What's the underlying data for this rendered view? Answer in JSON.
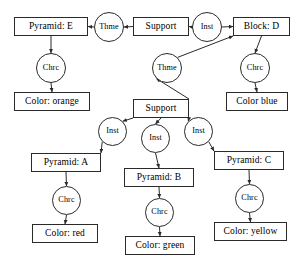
{
  "diagram": {
    "type": "graph",
    "title": "",
    "style": {
      "node_fill": "#ffffff",
      "node_stroke": "#2a2a2a",
      "edge_color": "#2a2a2a",
      "background": "#ffffff"
    },
    "nodes": [
      {
        "id": "pyramid_e",
        "label": "Pyramid: E",
        "shape": "box",
        "x": 14,
        "y": 17,
        "w": 74,
        "h": 19
      },
      {
        "id": "thme_top",
        "label": "Thme",
        "shape": "circle",
        "x": 94,
        "y": 12,
        "w": 30,
        "h": 30
      },
      {
        "id": "support_top",
        "label": "Support",
        "shape": "box",
        "x": 133,
        "y": 17,
        "w": 56,
        "h": 19
      },
      {
        "id": "inst_top",
        "label": "Inst",
        "shape": "circle",
        "x": 192,
        "y": 12,
        "w": 30,
        "h": 30
      },
      {
        "id": "block_d",
        "label": "Block: D",
        "shape": "box",
        "x": 233,
        "y": 17,
        "w": 57,
        "h": 19
      },
      {
        "id": "chrc_e",
        "label": "Chrc",
        "shape": "circle",
        "x": 36,
        "y": 53,
        "w": 30,
        "h": 30
      },
      {
        "id": "color_orange",
        "label": "Color: orange",
        "shape": "box",
        "x": 14,
        "y": 92,
        "w": 76,
        "h": 19
      },
      {
        "id": "thme_mid",
        "label": "Thme",
        "shape": "circle",
        "x": 152,
        "y": 53,
        "w": 30,
        "h": 30
      },
      {
        "id": "chrc_d",
        "label": "Chrc",
        "shape": "circle",
        "x": 240,
        "y": 53,
        "w": 30,
        "h": 30
      },
      {
        "id": "color_blue",
        "label": "Color blue",
        "shape": "box",
        "x": 226,
        "y": 92,
        "w": 62,
        "h": 19
      },
      {
        "id": "support_mid",
        "label": "Support",
        "shape": "box",
        "x": 133,
        "y": 99,
        "w": 56,
        "h": 19
      },
      {
        "id": "inst_a",
        "label": "Inst",
        "shape": "circle",
        "x": 98,
        "y": 117,
        "w": 29,
        "h": 29
      },
      {
        "id": "inst_b",
        "label": "Inst",
        "shape": "circle",
        "x": 141,
        "y": 124,
        "w": 29,
        "h": 29
      },
      {
        "id": "inst_c",
        "label": "Inst",
        "shape": "circle",
        "x": 184,
        "y": 117,
        "w": 29,
        "h": 29
      },
      {
        "id": "pyramid_a",
        "label": "Pyramid: A",
        "shape": "box",
        "x": 31,
        "y": 153,
        "w": 70,
        "h": 19
      },
      {
        "id": "pyramid_b",
        "label": "Pyramid: B",
        "shape": "box",
        "x": 124,
        "y": 168,
        "w": 70,
        "h": 19
      },
      {
        "id": "pyramid_c",
        "label": "Pyramid: C",
        "shape": "box",
        "x": 214,
        "y": 151,
        "w": 70,
        "h": 19
      },
      {
        "id": "chrc_a",
        "label": "Chrc",
        "shape": "circle",
        "x": 52,
        "y": 186,
        "w": 29,
        "h": 29
      },
      {
        "id": "chrc_b",
        "label": "Chrc",
        "shape": "circle",
        "x": 145,
        "y": 198,
        "w": 29,
        "h": 29
      },
      {
        "id": "chrc_c",
        "label": "Chrc",
        "shape": "circle",
        "x": 235,
        "y": 184,
        "w": 29,
        "h": 29
      },
      {
        "id": "color_red",
        "label": "Color: red",
        "shape": "box",
        "x": 32,
        "y": 224,
        "w": 66,
        "h": 19
      },
      {
        "id": "color_green",
        "label": "Color: green",
        "shape": "box",
        "x": 125,
        "y": 236,
        "w": 70,
        "h": 19
      },
      {
        "id": "color_yellow",
        "label": "Color: yellow",
        "shape": "box",
        "x": 214,
        "y": 222,
        "w": 73,
        "h": 19
      }
    ],
    "edges": [
      {
        "from": "thme_top",
        "to": "pyramid_e",
        "direction": "left"
      },
      {
        "from": "support_top",
        "to": "thme_top",
        "direction": "left"
      },
      {
        "from": "inst_top",
        "to": "support_top",
        "direction": "left"
      },
      {
        "from": "inst_top",
        "to": "block_d",
        "direction": "right"
      },
      {
        "from": "pyramid_e",
        "to": "chrc_e",
        "direction": "down"
      },
      {
        "from": "chrc_e",
        "to": "color_orange",
        "direction": "down"
      },
      {
        "from": "thme_mid",
        "to": "block_d",
        "direction": "up-right"
      },
      {
        "from": "block_d",
        "to": "chrc_d",
        "direction": "down"
      },
      {
        "from": "chrc_d",
        "to": "color_blue",
        "direction": "down"
      },
      {
        "from": "support_mid",
        "to": "thme_mid",
        "direction": "up-right"
      },
      {
        "from": "support_mid",
        "to": "inst_a",
        "direction": "down-left"
      },
      {
        "from": "support_mid",
        "to": "inst_b",
        "direction": "down"
      },
      {
        "from": "support_mid",
        "to": "inst_c",
        "direction": "down-right"
      },
      {
        "from": "inst_a",
        "to": "pyramid_a",
        "direction": "down-left"
      },
      {
        "from": "inst_b",
        "to": "pyramid_b",
        "direction": "down"
      },
      {
        "from": "inst_c",
        "to": "pyramid_c",
        "direction": "down-right"
      },
      {
        "from": "pyramid_a",
        "to": "chrc_a",
        "direction": "down"
      },
      {
        "from": "chrc_a",
        "to": "color_red",
        "direction": "down"
      },
      {
        "from": "pyramid_b",
        "to": "chrc_b",
        "direction": "down"
      },
      {
        "from": "chrc_b",
        "to": "color_green",
        "direction": "down"
      },
      {
        "from": "pyramid_c",
        "to": "chrc_c",
        "direction": "down"
      },
      {
        "from": "chrc_c",
        "to": "color_yellow",
        "direction": "down"
      }
    ]
  }
}
